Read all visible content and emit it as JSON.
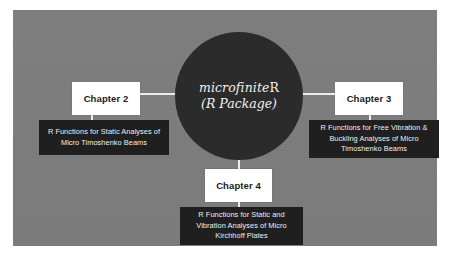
{
  "diagram": {
    "hub": {
      "title_prefix": "microfinite",
      "title_suffix": "R",
      "subtitle": "(R Package)",
      "shape": "circle",
      "fill_color": "#2b2b2b",
      "text_color": "#f2f2f2"
    },
    "panel": {
      "background_color": "#7c7c7c"
    },
    "connector_color": "#ededed",
    "nodes": [
      {
        "id": "chapter-2",
        "position": "left",
        "label": "Chapter 2",
        "label_box_color": "#ffffff",
        "label_text_color": "#1b1b1b",
        "description": "R Functions for Static Analyses of Micro Timoshenko Beams",
        "description_box_color": "#1f1f1f",
        "description_text_color": "#f0f0f0"
      },
      {
        "id": "chapter-3",
        "position": "right",
        "label": "Chapter 3",
        "label_box_color": "#ffffff",
        "label_text_color": "#1b1b1b",
        "description": "R Functions for Free Vibration & Buckling Analyses of Micro Timoshenko Beams",
        "description_box_color": "#1f1f1f",
        "description_text_color": "#f0f0f0"
      },
      {
        "id": "chapter-4",
        "position": "bottom",
        "label": "Chapter 4",
        "label_box_color": "#ffffff",
        "label_text_color": "#1b1b1b",
        "description": "R Functions for Static and Vibration Analyses of Micro Kirchhoff Plates",
        "description_box_color": "#1f1f1f",
        "description_text_color": "#f0f0f0"
      }
    ]
  }
}
